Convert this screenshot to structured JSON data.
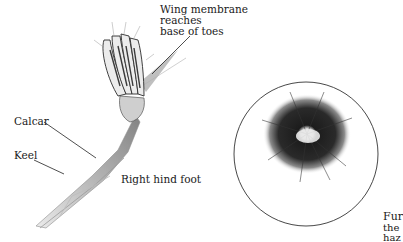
{
  "labels": {
    "wing_membrane": [
      "Wing membrane",
      "reaches",
      "base of toes"
    ],
    "calcar": "Calcar",
    "keel": "Keel",
    "right_hind_foot": "Right hind foot",
    "fur_caption": [
      "Fur",
      "the",
      "haz"
    ]
  },
  "figures": {
    "foot": "right-hind-foot-illustration",
    "fur": "fur-circle-illustration"
  }
}
